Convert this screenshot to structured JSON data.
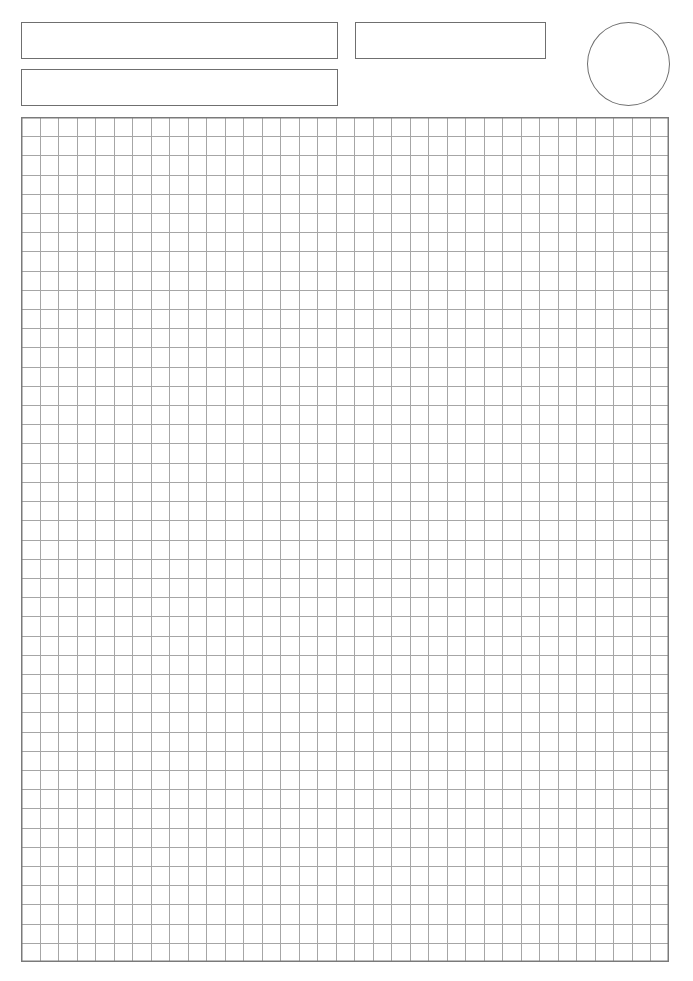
{
  "page": {
    "type": "blank grid worksheet",
    "background_color": "#ffffff"
  },
  "header": {
    "fields": [
      {
        "id": "top-left-field",
        "label": ""
      },
      {
        "id": "second-left-field",
        "label": ""
      },
      {
        "id": "top-right-field",
        "label": ""
      }
    ],
    "circle": {
      "id": "score-circle",
      "label": ""
    },
    "border_color": "#6f6f6f"
  },
  "grid": {
    "columns": 35,
    "rows": 44,
    "line_color": "#a6a6a6",
    "border_color": "#7a7a7a"
  }
}
